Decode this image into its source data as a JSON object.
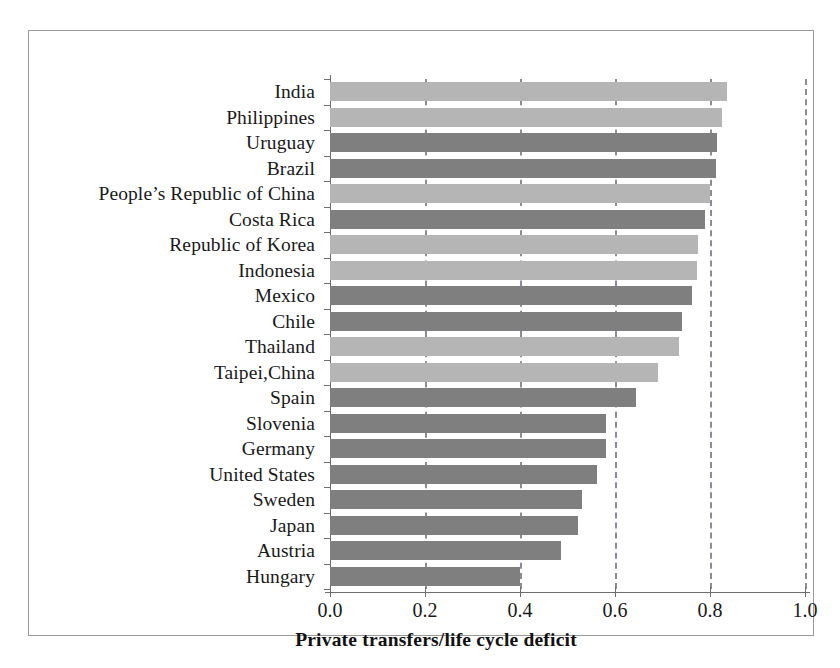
{
  "chart_data": {
    "type": "bar",
    "orientation": "horizontal",
    "title": "",
    "xlabel": "Private transfers/life cycle deficit",
    "ylabel": "",
    "xlim": [
      0.0,
      1.0
    ],
    "xticks": [
      "0.0",
      "0.2",
      "0.4",
      "0.6",
      "0.8",
      "1.0"
    ],
    "xtick_values": [
      0.0,
      0.2,
      0.4,
      0.6,
      0.8,
      1.0
    ],
    "grid": "vertical-dashed",
    "legend": "none",
    "categories": [
      "India",
      "Philippines",
      "Uruguay",
      "Brazil",
      "People’s Republic of China",
      "Costa Rica",
      "Republic of Korea",
      "Indonesia",
      "Mexico",
      "Chile",
      "Thailand",
      "Taipei,China",
      "Spain",
      "Slovenia",
      "Germany",
      "United States",
      "Sweden",
      "Japan",
      "Austria",
      "Hungary"
    ],
    "values": [
      0.835,
      0.825,
      0.815,
      0.812,
      0.8,
      0.79,
      0.775,
      0.773,
      0.762,
      0.74,
      0.735,
      0.69,
      0.645,
      0.582,
      0.58,
      0.562,
      0.53,
      0.522,
      0.487,
      0.4
    ],
    "series_groups": [
      "a",
      "a",
      "b",
      "b",
      "a",
      "b",
      "a",
      "a",
      "b",
      "b",
      "a",
      "a",
      "b",
      "b",
      "b",
      "b",
      "b",
      "b",
      "b",
      "b"
    ],
    "colors": {
      "group_a": "#b5b5b5",
      "group_b": "#7f7f7f",
      "axis": "#6e6e6e",
      "gridline": "#8c8c99",
      "frame": "#9a9a9a",
      "text": "#191919",
      "background": "#ffffff"
    }
  }
}
